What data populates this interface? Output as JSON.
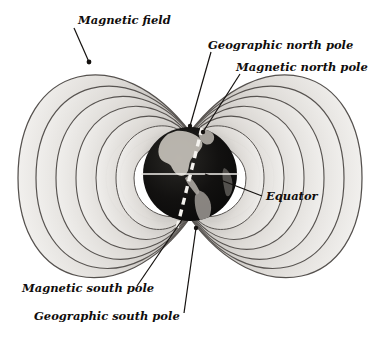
{
  "diagram": {
    "background_color": "#ffffff",
    "labels": {
      "magnetic_field": "Magnetic field",
      "geographic_north_pole": "Geographic north pole",
      "magnetic_north_pole": "Magnetic north pole",
      "equator": "Equator",
      "magnetic_south_pole": "Magnetic south pole",
      "geographic_south_pole": "Geographic south pole"
    },
    "colors": {
      "label_text": "#100d0c",
      "leader_line": "#14110f",
      "field_line_stroke": "#55514e",
      "field_band_light": "#f2f1ef",
      "field_band_mid": "#d9d7d4",
      "field_band_dark": "#b8b5b1",
      "globe_dark": "#090909",
      "globe_land": "#cfcac4",
      "axis_dashed": "#f4f2ee",
      "equator_line": "#f2efeb"
    },
    "globe": {
      "name": "earth-globe",
      "center_x": 190,
      "center_y": 174,
      "radius": 47,
      "equator_line": true,
      "rotation_axis_dashed": true,
      "axis_tilt_degrees": 11
    },
    "field_loops": {
      "count_per_side": 6,
      "sides": [
        "west",
        "east"
      ],
      "shape": "dipole-lobes"
    }
  }
}
